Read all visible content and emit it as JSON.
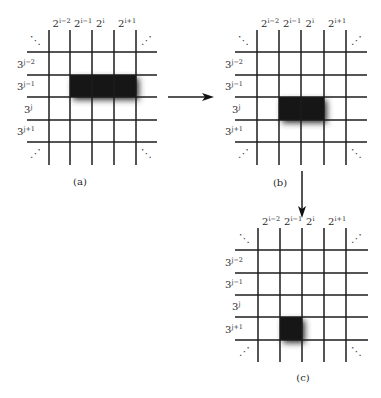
{
  "diagram": {
    "panels": [
      {
        "id": "a",
        "caption": "(a)",
        "caption_pos": [
          80,
          185
        ],
        "x_lines": [
          49,
          70,
          92,
          114,
          136
        ],
        "y_lines": [
          52,
          75,
          97,
          120,
          142
        ],
        "h_span": [
          27,
          157
        ],
        "v_span": [
          30,
          165
        ],
        "col_labels": [
          {
            "base": "2",
            "exp": "i−2"
          },
          {
            "base": "2",
            "exp": "i−1"
          },
          {
            "base": "2",
            "exp": "i"
          },
          {
            "base": "2",
            "exp": "i+1"
          }
        ],
        "row_labels": [
          {
            "base": "3",
            "exp": "j−2"
          },
          {
            "base": "3",
            "exp": "j−1"
          },
          {
            "base": "3",
            "exp": "j"
          },
          {
            "base": "3",
            "exp": "j+1"
          }
        ],
        "highlight": {
          "x": 70,
          "y": 75,
          "w": 66,
          "h": 22
        }
      },
      {
        "id": "b",
        "caption": "(b)",
        "caption_pos": [
          280,
          186
        ],
        "x_lines": [
          257,
          279,
          301,
          324,
          346
        ],
        "y_lines": [
          52,
          75,
          97,
          120,
          142
        ],
        "h_span": [
          235,
          367
        ],
        "v_span": [
          30,
          165
        ],
        "col_labels": [
          {
            "base": "2",
            "exp": "i−2"
          },
          {
            "base": "2",
            "exp": "i−1"
          },
          {
            "base": "2",
            "exp": "i"
          },
          {
            "base": "2",
            "exp": "i+1"
          }
        ],
        "row_labels": [
          {
            "base": "3",
            "exp": "j−2"
          },
          {
            "base": "3",
            "exp": "j−1"
          },
          {
            "base": "3",
            "exp": "j"
          },
          {
            "base": "3",
            "exp": "j+1"
          }
        ],
        "highlight": {
          "x": 279,
          "y": 97,
          "w": 45,
          "h": 23
        }
      },
      {
        "id": "c",
        "caption": "(c)",
        "caption_pos": [
          303,
          381
        ],
        "x_lines": [
          258,
          280,
          302,
          324,
          346
        ],
        "y_lines": [
          250,
          273,
          295,
          317,
          340
        ],
        "h_span": [
          235,
          368
        ],
        "v_span": [
          228,
          362
        ],
        "col_labels": [
          {
            "base": "2",
            "exp": "i−2"
          },
          {
            "base": "2",
            "exp": "i−1"
          },
          {
            "base": "2",
            "exp": "i"
          },
          {
            "base": "2",
            "exp": "i+1"
          }
        ],
        "row_labels": [
          {
            "base": "3",
            "exp": "j−2"
          },
          {
            "base": "3",
            "exp": "j−1"
          },
          {
            "base": "3",
            "exp": "j"
          },
          {
            "base": "3",
            "exp": "j+1"
          }
        ],
        "highlight": {
          "x": 280,
          "y": 317,
          "w": 22,
          "h": 23
        }
      }
    ],
    "arrows": [
      {
        "id": "a-to-b",
        "from": [
          168,
          97
        ],
        "to": [
          214,
          97
        ],
        "direction": "right"
      },
      {
        "id": "b-to-c",
        "from": [
          302,
          171
        ],
        "to": [
          302,
          218
        ],
        "direction": "down"
      }
    ],
    "ellipsis": {
      "diag_down": "⋱",
      "diag_up": "⋰"
    },
    "colors": {
      "line": "#1c1c1c",
      "cell": "#161616",
      "text": "#2a2a2a"
    }
  }
}
